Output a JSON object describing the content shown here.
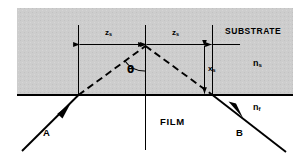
{
  "figure": {
    "regions": {
      "substrate": {
        "label": "SUBSTRATE",
        "index_symbol": "n",
        "index_subscript": "s",
        "fill_color": "#cdcdcd"
      },
      "film": {
        "label": "FILM",
        "index_symbol": "n",
        "index_subscript": "f",
        "fill_color": "#ffffff"
      }
    },
    "rays": {
      "incoming": {
        "label": "A",
        "style": "solid",
        "arrow": "up-right"
      },
      "outgoing": {
        "label": "B",
        "style": "solid",
        "arrow": "down-right"
      },
      "virtual_left": {
        "style": "dashed"
      },
      "virtual_right": {
        "style": "dashed"
      }
    },
    "dimensions": {
      "left": {
        "symbol": "z",
        "subscript": "s"
      },
      "right": {
        "symbol": "z",
        "subscript": "s"
      },
      "depth": {
        "symbol": "x",
        "subscript": "s"
      }
    },
    "angle": {
      "symbol": "θ"
    },
    "colors": {
      "line": "#000000",
      "shading": "#cdcdcd",
      "background": "#ffffff"
    }
  }
}
